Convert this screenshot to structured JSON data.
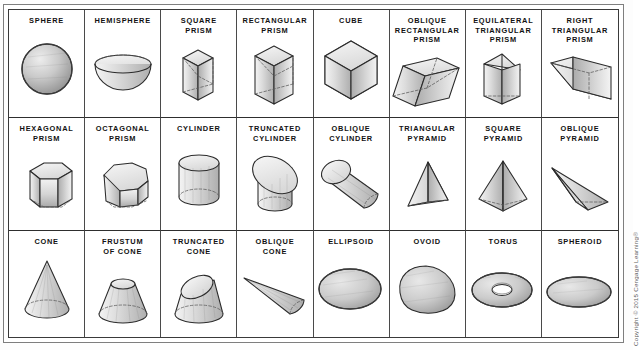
{
  "figure": {
    "copyright": "Copyright © 2015 Cengage Learning®",
    "rows": 3,
    "columns": 8,
    "line_color": "#2e2e2e",
    "fill_light": "#efefef",
    "fill_mid": "#cfcfcf",
    "fill_dark": "#a8a8a8",
    "background": "#ffffff"
  },
  "cells": [
    {
      "label": "SPHERE",
      "shape": "sphere"
    },
    {
      "label": "HEMISPHERE",
      "shape": "hemisphere"
    },
    {
      "label": "SQUARE\nPRISM",
      "shape": "square-prism"
    },
    {
      "label": "RECTANGULAR\nPRISM",
      "shape": "rectangular-prism"
    },
    {
      "label": "CUBE",
      "shape": "cube"
    },
    {
      "label": "OBLIQUE\nRECTANGULAR\nPRISM",
      "shape": "oblique-rectangular-prism"
    },
    {
      "label": "EQUILATERAL\nTRIANGULAR\nPRISM",
      "shape": "equilateral-triangular-prism"
    },
    {
      "label": "RIGHT\nTRIANGULAR\nPRISM",
      "shape": "right-triangular-prism"
    },
    {
      "label": "HEXAGONAL\nPRISM",
      "shape": "hexagonal-prism"
    },
    {
      "label": "OCTAGONAL\nPRISM",
      "shape": "octagonal-prism"
    },
    {
      "label": "CYLINDER",
      "shape": "cylinder"
    },
    {
      "label": "TRUNCATED\nCYLINDER",
      "shape": "truncated-cylinder"
    },
    {
      "label": "OBLIQUE\nCYLINDER",
      "shape": "oblique-cylinder"
    },
    {
      "label": "TRIANGULAR\nPYRAMID",
      "shape": "triangular-pyramid"
    },
    {
      "label": "SQUARE\nPYRAMID",
      "shape": "square-pyramid"
    },
    {
      "label": "OBLIQUE\nPYRAMID",
      "shape": "oblique-pyramid"
    },
    {
      "label": "CONE",
      "shape": "cone"
    },
    {
      "label": "FRUSTUM\nOF CONE",
      "shape": "frustum-of-cone"
    },
    {
      "label": "TRUNCATED\nCONE",
      "shape": "truncated-cone"
    },
    {
      "label": "OBLIQUE\nCONE",
      "shape": "oblique-cone"
    },
    {
      "label": "ELLIPSOID",
      "shape": "ellipsoid"
    },
    {
      "label": "OVOID",
      "shape": "ovoid"
    },
    {
      "label": "TORUS",
      "shape": "torus"
    },
    {
      "label": "SPHEROID",
      "shape": "spheroid"
    }
  ]
}
